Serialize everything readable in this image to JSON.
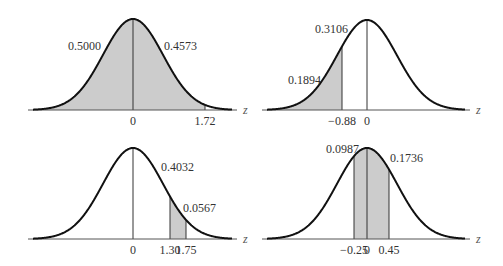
{
  "panels": [
    {
      "id": "p1",
      "axis_label": "z",
      "origin": {
        "cx": 133,
        "axisY": 110,
        "peakY": 19,
        "x0": 28,
        "x1": 237,
        "sigma": 30
      },
      "shaded": [
        {
          "from_px": 33,
          "to_px": 205
        }
      ],
      "vlines_px": [
        133,
        205
      ],
      "ticks": [
        {
          "label": "0",
          "x": 133
        },
        {
          "label": "1.72",
          "x": 205
        }
      ],
      "areas": [
        {
          "label": "0.5000",
          "x": 68,
          "y": 50
        },
        {
          "label": "0.4573",
          "x": 164,
          "y": 50
        }
      ]
    },
    {
      "id": "p2",
      "axis_label": "z",
      "origin": {
        "cx": 367,
        "axisY": 110,
        "peakY": 20,
        "x0": 262,
        "x1": 470,
        "sigma": 30
      },
      "shaded": [
        {
          "from_px": 268,
          "to_px": 342
        }
      ],
      "vlines_px": [
        342,
        367
      ],
      "ticks": [
        {
          "label": "−0.88",
          "x": 342
        },
        {
          "label": "0",
          "x": 367
        }
      ],
      "areas": [
        {
          "label": "0.3106",
          "x": 315,
          "y": 33
        },
        {
          "label": "0.1894",
          "x": 288,
          "y": 84
        }
      ]
    },
    {
      "id": "p3",
      "axis_label": "z",
      "origin": {
        "cx": 133,
        "axisY": 239,
        "peakY": 148,
        "x0": 28,
        "x1": 237,
        "sigma": 30
      },
      "shaded": [
        {
          "from_px": 170,
          "to_px": 186
        }
      ],
      "vlines_px": [
        133,
        170,
        186
      ],
      "ticks": [
        {
          "label": "0",
          "x": 133
        },
        {
          "label": "1.30",
          "x": 170
        },
        {
          "label": "1.75",
          "x": 186
        }
      ],
      "areas": [
        {
          "label": "0.4032",
          "x": 161,
          "y": 171
        },
        {
          "label": "0.0567",
          "x": 183,
          "y": 212
        }
      ]
    },
    {
      "id": "p4",
      "axis_label": "z",
      "origin": {
        "cx": 367,
        "axisY": 239,
        "peakY": 148,
        "x0": 262,
        "x1": 470,
        "sigma": 30
      },
      "shaded": [
        {
          "from_px": 354,
          "to_px": 389
        }
      ],
      "vlines_px": [
        354,
        367,
        389
      ],
      "ticks": [
        {
          "label": "−0.25",
          "x": 354
        },
        {
          "label": "0",
          "x": 367
        },
        {
          "label": "0.45",
          "x": 389
        }
      ],
      "areas": [
        {
          "label": "0.0987",
          "x": 326,
          "y": 153
        },
        {
          "label": "0.1736",
          "x": 390,
          "y": 162
        }
      ]
    }
  ],
  "colors": {
    "curve": "#111111",
    "shade": "#cccccc",
    "axis": "#555555",
    "vline": "#333333"
  }
}
